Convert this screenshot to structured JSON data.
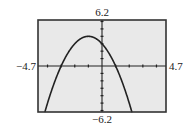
{
  "chart_data": {
    "type": "line",
    "title": "",
    "function": "y = -x^2 - 2x + 3",
    "xlabel": "",
    "ylabel": "",
    "xlim": [
      -4.7,
      4.7
    ],
    "ylim": [
      -6.2,
      6.2
    ],
    "x_tick_step": 1,
    "y_tick_step": 1,
    "grid": false,
    "legend": null,
    "window_labels": {
      "ymax": "6.2",
      "ymin": "-6.2",
      "xmin": "-4.7",
      "xmax": "4.7"
    },
    "series": [
      {
        "name": "parabola",
        "x": [
          -4.19,
          -4,
          -3.5,
          -3,
          -2.5,
          -2,
          -1.5,
          -1,
          -0.5,
          0,
          0.5,
          1,
          1.5,
          2,
          2.19
        ],
        "y": [
          -6.2,
          -5,
          -3.25,
          0,
          1.75,
          3,
          3.75,
          4,
          3.75,
          3,
          1.75,
          0,
          -3.25,
          -5,
          -6.2
        ]
      }
    ],
    "key_points": {
      "vertex": [
        -1,
        4
      ],
      "x_intercepts": [
        [
          -3,
          0
        ],
        [
          1,
          0
        ]
      ],
      "y_intercept": [
        0,
        3
      ]
    },
    "colors": {
      "background": "#e9e9e9",
      "frame": "#333333",
      "axes": "#222222",
      "curve": "#222222"
    }
  }
}
